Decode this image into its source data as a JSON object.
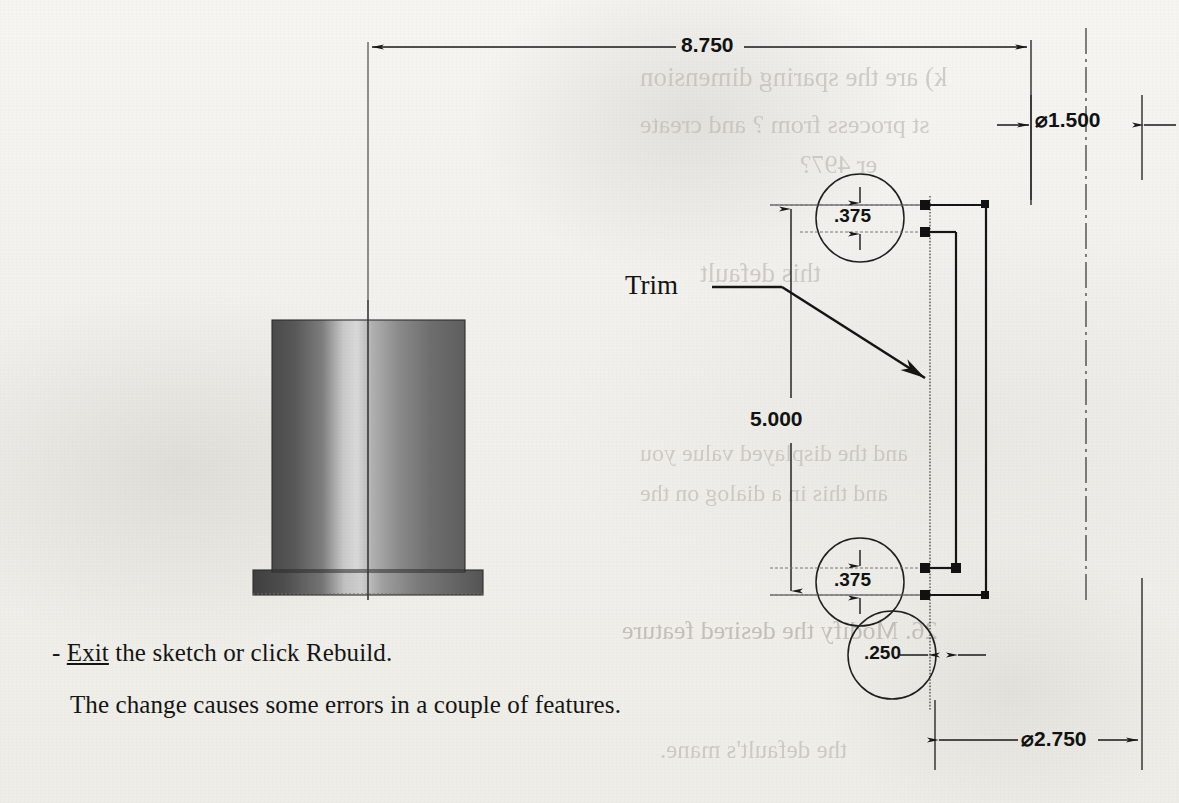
{
  "document": {
    "kind": "scanned-textbook-page",
    "background_color": "#f1f0ec",
    "ink_color": "#141414"
  },
  "drawing": {
    "title_hint": "SolidWorks sketch dimension edit",
    "leader_label": "Trim",
    "dimensions": [
      {
        "name": "overall-length",
        "value": "8.750",
        "orientation": "horizontal",
        "symbol": ""
      },
      {
        "name": "bore-diameter",
        "value": "1.500",
        "orientation": "horizontal",
        "symbol": "⌀"
      },
      {
        "name": "flange-diameter",
        "value": "2.750",
        "orientation": "horizontal",
        "symbol": "⌀"
      },
      {
        "name": "body-length",
        "value": "5.000",
        "orientation": "vertical",
        "symbol": ""
      },
      {
        "name": "upper-step-thickness",
        "value": ".375",
        "orientation": "vertical",
        "symbol": ""
      },
      {
        "name": "lower-step-thickness",
        "value": ".375",
        "orientation": "vertical",
        "symbol": ""
      },
      {
        "name": "wall-thickness",
        "value": ".250",
        "orientation": "horizontal",
        "symbol": ""
      }
    ],
    "detail_circles": [
      {
        "name": "detail-circle-upper",
        "label": ".375"
      },
      {
        "name": "detail-circle-lower",
        "label": ".375"
      },
      {
        "name": "detail-circle-wall",
        "label": ".250"
      }
    ]
  },
  "instructions": {
    "bullet": "-",
    "line1_link": "Exit",
    "line1_rest": " the sketch or click Rebuild.",
    "line2": "The change causes some errors in a couple of features."
  },
  "showthrough": {
    "note": "faint mirrored text bleeding through from the reverse side of the printed page",
    "fragments": [
      {
        "text": "k) are the sparing dimension",
        "x": 640,
        "y": 76,
        "size": 27
      },
      {
        "text": "st process from ? and create",
        "x": 640,
        "y": 124,
        "size": 26
      },
      {
        "text": "er 497?",
        "x": 660,
        "y": 162,
        "size": 26
      },
      {
        "text": "this default",
        "x": 660,
        "y": 270,
        "size": 27
      },
      {
        "text": "and the displayed value you",
        "x": 640,
        "y": 452,
        "size": 24
      },
      {
        "text": "and this in a dialog on the",
        "x": 640,
        "y": 492,
        "size": 24
      },
      {
        "text": "26. Modify the desired feature",
        "x": 622,
        "y": 628,
        "size": 26
      },
      {
        "text": "the default's mane.",
        "x": 660,
        "y": 748,
        "size": 25
      }
    ]
  },
  "model": {
    "name": "shaded-cylindrical-part",
    "body": {
      "x": 272,
      "y": 320,
      "w": 193,
      "h": 250
    },
    "flange": {
      "x": 253,
      "y": 570,
      "w": 230,
      "h": 25
    }
  }
}
